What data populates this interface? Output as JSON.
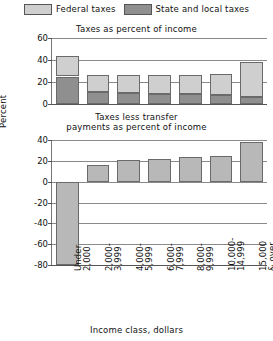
{
  "legend": {
    "items": [
      {
        "label": "Federal taxes",
        "color": "#cfcfcf",
        "name": "federal-taxes"
      },
      {
        "label": "State and local taxes",
        "color": "#8f8f8f",
        "name": "state-local-taxes"
      }
    ]
  },
  "axis": {
    "ylabel": "Percent",
    "xlabel": "Income class, dollars"
  },
  "categories": [
    "Under\n2,000",
    "2,000-\n3,999",
    "4,000-\n5,999",
    "6,000-\n7,999",
    "8,000-\n9,999",
    "10,000-\n14,999",
    "15,000\n& over"
  ],
  "chart_data": [
    {
      "type": "bar",
      "title": "Taxes as percent of income",
      "stacked": true,
      "categories": [
        "Under 2,000",
        "2,000-3,999",
        "4,000-5,999",
        "6,000-7,999",
        "8,000-9,999",
        "10,000-14,999",
        "15,000 & over"
      ],
      "series": [
        {
          "name": "State and local taxes",
          "color": "#8f8f8f",
          "values": [
            25,
            11,
            10,
            9,
            9,
            8,
            6
          ]
        },
        {
          "name": "Federal taxes",
          "color": "#cfcfcf",
          "values": [
            19,
            15,
            16,
            17,
            17,
            19,
            32
          ]
        }
      ],
      "totals": [
        44,
        26,
        26,
        26,
        26,
        27,
        38
      ],
      "ylabel": "Percent",
      "xlabel": "Income class, dollars",
      "ylim": [
        0,
        60
      ],
      "yticks": [
        0,
        20,
        40,
        60
      ],
      "grid": true,
      "legend_position": "top"
    },
    {
      "type": "bar",
      "title": "Taxes less transfer payments as percent of income",
      "stacked": false,
      "categories": [
        "Under 2,000",
        "2,000-3,999",
        "4,000-5,999",
        "6,000-7,999",
        "8,000-9,999",
        "10,000-14,999",
        "15,000 & over"
      ],
      "series": [
        {
          "name": "Taxes less transfer payments",
          "color": "#b8b8b8",
          "values": [
            -80,
            16,
            21,
            22,
            24,
            25,
            38
          ]
        }
      ],
      "ylabel": "Percent",
      "xlabel": "Income class, dollars",
      "ylim": [
        -80,
        40
      ],
      "yticks": [
        40,
        20,
        0,
        -20,
        -40,
        -60,
        -80
      ],
      "grid": true,
      "legend_position": "none"
    }
  ],
  "titles": {
    "top": "Taxes as percent of income",
    "bottom_line1": "Taxes less transfer",
    "bottom_line2": "payments as percent of income"
  },
  "yticks_top": [
    "60",
    "40",
    "20",
    "0"
  ],
  "yticks_bottom": [
    "40",
    "20",
    "0",
    "-20",
    "-40",
    "-60",
    "-80"
  ]
}
